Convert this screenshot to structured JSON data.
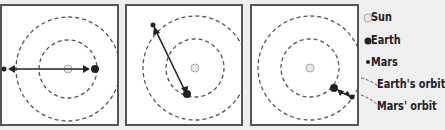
{
  "panels": [
    {
      "id": 1,
      "description": "Earth and Mars on opposite sides of the Sun (conjunction)"
    },
    {
      "id": 2,
      "description": "Earth and Mars at intermediate positions"
    },
    {
      "id": 3,
      "description": "Earth and Mars aligned on the same side (opposition)"
    }
  ],
  "legend": {
    "sun": "Sun",
    "earth": "Earth",
    "mars": "Mars",
    "earth_orbit": "Earth's orbit",
    "mars_orbit": "Mars' orbit"
  },
  "colors": {
    "panel_border": "#555555",
    "orbit": "#555555",
    "sun_fill": "#e8e8e8",
    "earth": "#222222",
    "mars": "#222222",
    "background": "#efefef"
  }
}
